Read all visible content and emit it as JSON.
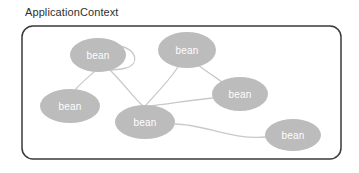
{
  "diagram": {
    "title": "ApplicationContext",
    "type": "node-graph",
    "container": {
      "name": "application-context-box",
      "x": 22,
      "y": 26,
      "width": 319,
      "height": 133,
      "corner_radius": 11,
      "stroke_color": "#3a3a3a",
      "stroke_width": 1.5,
      "fill_color": "#ffffff"
    },
    "node_style": {
      "fill_color": "#bcbcbc",
      "text_color": "#ffffff",
      "font_size": 10
    },
    "edge_style": {
      "stroke_color": "#c9c9c9",
      "stroke_width": 1.3
    },
    "nodes": [
      {
        "id": "bean-top-left",
        "label": "bean",
        "cx": 98,
        "cy": 55,
        "rx": 28,
        "ry": 17
      },
      {
        "id": "bean-top-middle",
        "label": "bean",
        "cx": 187,
        "cy": 50,
        "rx": 29,
        "ry": 18
      },
      {
        "id": "bean-left",
        "label": "bean",
        "cx": 70,
        "cy": 106,
        "rx": 30,
        "ry": 17
      },
      {
        "id": "bean-center",
        "label": "bean",
        "cx": 145,
        "cy": 122,
        "rx": 30,
        "ry": 17
      },
      {
        "id": "bean-right",
        "label": "bean",
        "cx": 240,
        "cy": 94,
        "rx": 28,
        "ry": 17
      },
      {
        "id": "bean-bottom-right",
        "label": "bean",
        "cx": 293,
        "cy": 135,
        "rx": 28,
        "ry": 16
      }
    ],
    "edges": [
      {
        "id": "edge-top-left-self-loop",
        "from": "bean-top-left",
        "to": "bean-top-left",
        "path": "M 120 46 C 137 50 140 64 126 68 C 114 71 103 70 96 70"
      },
      {
        "id": "edge-top-left-to-left",
        "from": "bean-top-left",
        "to": "bean-left",
        "path": "M 94 72 C 86 79 80 84 76 89"
      },
      {
        "id": "edge-top-left-to-center",
        "from": "bean-top-left",
        "to": "bean-center",
        "path": "M 110 70 C 124 84 134 98 142 105"
      },
      {
        "id": "edge-top-middle-to-center",
        "from": "bean-top-middle",
        "to": "bean-center",
        "path": "M 178 67 C 168 82 154 96 146 105"
      },
      {
        "id": "edge-top-middle-to-right",
        "from": "bean-top-middle",
        "to": "bean-right",
        "path": "M 198 65 C 210 74 218 79 225 84"
      },
      {
        "id": "edge-right-to-center",
        "from": "bean-right",
        "to": "bean-center",
        "path": "M 213 98 C 192 100 168 104 150 106"
      },
      {
        "id": "edge-center-to-bottom-right",
        "from": "bean-center",
        "to": "bean-bottom-right",
        "path": "M 175 124 C 203 124 231 140 266 137"
      }
    ]
  }
}
